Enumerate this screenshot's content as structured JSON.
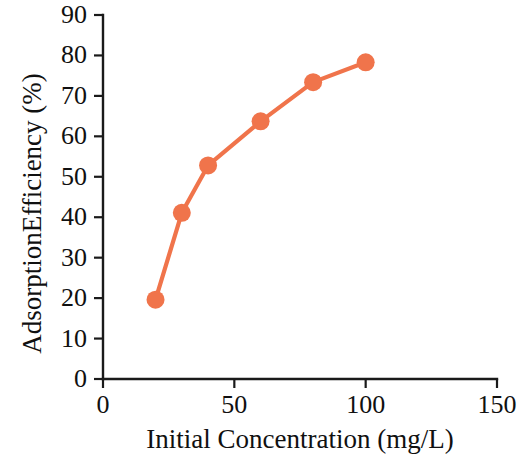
{
  "chart_data": {
    "type": "line",
    "title": "",
    "subtitle": "",
    "xlabel": "Initial Concentration (mg/L)",
    "ylabel": "AdsorptionEfficiency (%)",
    "xlim": [
      0,
      150
    ],
    "ylim": [
      0,
      90
    ],
    "xticks": [
      0,
      50,
      100,
      150
    ],
    "yticks": [
      0,
      10,
      20,
      30,
      40,
      50,
      60,
      70,
      80,
      90
    ],
    "xtick_labels": [
      "0",
      "50",
      "100",
      "150"
    ],
    "ytick_labels": [
      "0",
      "10",
      "20",
      "30",
      "40",
      "50",
      "60",
      "70",
      "80",
      "90"
    ],
    "grid": false,
    "legend": false,
    "legend_position": "none",
    "series": [
      {
        "name": "Adsorption Efficiency",
        "color": "#F0744B",
        "marker": "circle",
        "x": [
          20,
          30,
          40,
          60,
          80,
          100
        ],
        "y": [
          19.6,
          41.1,
          52.8,
          63.7,
          73.4,
          78.3
        ]
      }
    ]
  },
  "axis": {
    "y_title": "AdsorptionEfficiency (%)",
    "x_title": "Initial Concentration (mg/L)"
  },
  "colors": {
    "series": "#F0744B",
    "axis": "#1a1a1a",
    "background": "#ffffff"
  }
}
